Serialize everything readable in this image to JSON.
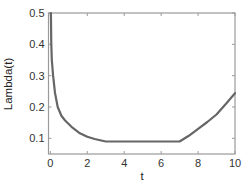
{
  "chart_data": {
    "type": "line",
    "title": "",
    "xlabel": "t",
    "ylabel": "Lambda(t)",
    "xlim": [
      -0.1,
      10
    ],
    "ylim": [
      0.05,
      0.5
    ],
    "xticks": [
      0,
      2,
      4,
      6,
      8,
      10
    ],
    "xtick_labels": [
      "0",
      "2",
      "4",
      "6",
      "8",
      "10"
    ],
    "yticks": [
      0.1,
      0.2,
      0.3,
      0.4,
      0.5
    ],
    "ytick_labels": [
      "0.1",
      "0.2",
      "0.3",
      "0.4",
      "0.5"
    ],
    "grid": false,
    "legend": null,
    "series": [
      {
        "name": "Lambda(t)",
        "color": "#666666",
        "x": [
          0.03,
          0.05,
          0.08,
          0.15,
          0.25,
          0.4,
          0.6,
          0.8,
          1.2,
          1.6,
          2.0,
          2.4,
          2.7,
          3.0,
          4.0,
          5.0,
          6.0,
          7.0,
          7.5,
          8.0,
          8.5,
          9.0,
          9.5,
          10.0
        ],
        "values": [
          0.5,
          0.4,
          0.35,
          0.3,
          0.245,
          0.2,
          0.172,
          0.157,
          0.134,
          0.116,
          0.105,
          0.098,
          0.094,
          0.09,
          0.09,
          0.09,
          0.09,
          0.09,
          0.108,
          0.13,
          0.152,
          0.176,
          0.21,
          0.244
        ]
      }
    ]
  }
}
